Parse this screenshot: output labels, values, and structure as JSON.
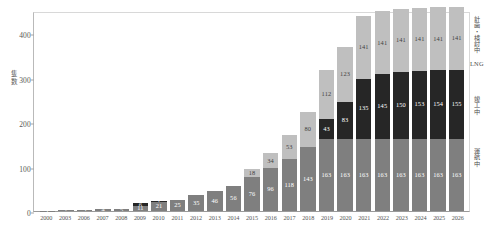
{
  "chart_data": {
    "type": "bar",
    "stacked": true,
    "title": "",
    "xlabel": "",
    "ylabel": "隻数",
    "ylim": [
      0,
      450
    ],
    "yticks": [
      0,
      100,
      200,
      300,
      400
    ],
    "grid": false,
    "legend_position": "right",
    "categories": [
      "2000",
      "2003",
      "2006",
      "2007",
      "2008",
      "2009",
      "2010",
      "2011",
      "2012",
      "2013",
      "2014",
      "2015",
      "2016",
      "2017",
      "2018",
      "2019",
      "2020",
      "2021",
      "2022",
      "2023",
      "2024",
      "2025",
      "2026"
    ],
    "series": [
      {
        "name": "運航中",
        "color": "#7f7f7f",
        "values": [
          1,
          2,
          3,
          4,
          5,
          11,
          21,
          25,
          35,
          46,
          56,
          76,
          96,
          118,
          143,
          163,
          163,
          163,
          163,
          163,
          163,
          163,
          163
        ]
      },
      {
        "name": "竣工中",
        "color": "#262626",
        "values": [
          0,
          0,
          0,
          0,
          0,
          6,
          1,
          0,
          0,
          0,
          0,
          0,
          0,
          0,
          0,
          43,
          83,
          135,
          145,
          150,
          153,
          154,
          155
        ]
      },
      {
        "name": "計画中",
        "color": "#bfbfbf",
        "values": [
          0,
          0,
          0,
          0,
          0,
          0,
          0,
          0,
          0,
          0,
          0,
          18,
          34,
          53,
          80,
          112,
          123,
          141,
          141,
          141,
          141,
          141,
          141
        ]
      }
    ],
    "bar_labels": [
      [
        "1",
        "",
        ""
      ],
      [
        "2",
        "",
        ""
      ],
      [
        "3",
        "",
        ""
      ],
      [
        "4",
        "",
        ""
      ],
      [
        "5",
        "",
        ""
      ],
      [
        "11",
        "6",
        ""
      ],
      [
        "21",
        "1",
        ""
      ],
      [
        "25",
        "",
        ""
      ],
      [
        "35",
        "",
        ""
      ],
      [
        "46",
        "",
        ""
      ],
      [
        "56",
        "",
        ""
      ],
      [
        "76",
        "",
        "18"
      ],
      [
        "96",
        "",
        "34"
      ],
      [
        "118",
        "",
        "53"
      ],
      [
        "143",
        "",
        "80"
      ],
      [
        "163",
        "43",
        "112"
      ],
      [
        "163",
        "83",
        "123"
      ],
      [
        "163",
        "135",
        "141"
      ],
      [
        "163",
        "145",
        "141"
      ],
      [
        "163",
        "150",
        "141"
      ],
      [
        "163",
        "153",
        "141"
      ],
      [
        "163",
        "154",
        "141"
      ],
      [
        "163",
        "155",
        "141"
      ]
    ],
    "annotations": {
      "planned": "計画・検討中",
      "planned_sub": "LNG",
      "ordered": "竣工中",
      "operating": "運航中"
    }
  }
}
